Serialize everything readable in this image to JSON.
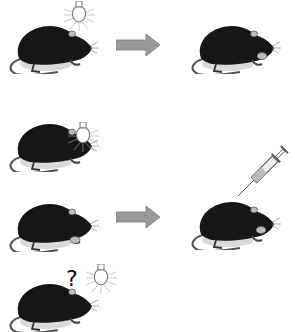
{
  "diagram": {
    "type": "classical-conditioning-illustration",
    "rows": [
      {
        "id": "row1",
        "left": {
          "subject": "rat",
          "stimulus": "lightbulb-above",
          "food": true
        },
        "arrow": true,
        "right": {
          "subject": "rat",
          "action": "eating",
          "food": true
        }
      },
      {
        "id": "row2",
        "left": {
          "subject": "rat",
          "stimulus": "lightbulb-in-front"
        },
        "arrow": false
      },
      {
        "id": "row3",
        "left": {
          "subject": "rat",
          "food": true
        },
        "arrow": true,
        "right": {
          "subject": "rat",
          "injection": "syringe",
          "food": true
        }
      },
      {
        "id": "row4",
        "left": {
          "subject": "rat",
          "stimulus": "lightbulb",
          "label": "?"
        },
        "arrow": false
      }
    ],
    "question_mark": "?",
    "colors": {
      "rat": "#111111",
      "arrow": "#9a9a9a",
      "arrow_edge": "#7a7a7a",
      "bulb": "#888888",
      "background": "#ffffff"
    }
  }
}
